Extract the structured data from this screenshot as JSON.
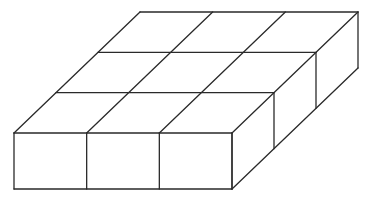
{
  "diagram": {
    "grid": {
      "columns": 3,
      "rows": 3,
      "layers": 1
    },
    "cube_count": 9,
    "line_color": "#2a2a2a",
    "background": "#ffffff"
  }
}
